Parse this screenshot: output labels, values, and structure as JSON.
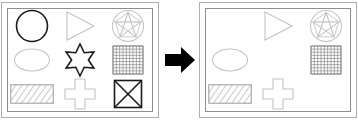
{
  "puzzle": {
    "title": "Shape set transformation",
    "type": "visual-analogy",
    "operator_label": "transforms-to",
    "arrow_direction": "right",
    "arrow_color": "#000000"
  },
  "colors": {
    "dark_stroke": "#1a1a1a",
    "light_stroke": "#c4c4c4",
    "grid_stroke": "#8a8a8a",
    "hatch_stroke": "#9a9a9a",
    "panel_border": "#aeaeae",
    "panel_inner_border": "#8d8d8d",
    "background": "#ffffff"
  },
  "panels": [
    {
      "id": "left",
      "name": "input-panel",
      "label": "Input set",
      "cells": [
        {
          "index": 0,
          "shape": "circle",
          "label": "Circle",
          "stroke": "dark",
          "present": true
        },
        {
          "index": 1,
          "shape": "triangle-right",
          "label": "Right triangle",
          "stroke": "light",
          "present": true
        },
        {
          "index": 2,
          "shape": "pentagram-circle",
          "label": "Pentagram in circle",
          "stroke": "light",
          "present": true
        },
        {
          "index": 3,
          "shape": "ellipse",
          "label": "Ellipse",
          "stroke": "light",
          "present": true
        },
        {
          "index": 4,
          "shape": "star-six",
          "label": "Six-pointed star",
          "stroke": "dark",
          "present": true
        },
        {
          "index": 5,
          "shape": "grid-square",
          "label": "Grid square",
          "stroke": "grid",
          "present": true
        },
        {
          "index": 6,
          "shape": "hatched-rect",
          "label": "Hatched rectangle",
          "stroke": "hatch",
          "present": true
        },
        {
          "index": 7,
          "shape": "cross",
          "label": "Cross",
          "stroke": "light",
          "present": true
        },
        {
          "index": 8,
          "shape": "crossed-square",
          "label": "Square with X",
          "stroke": "dark",
          "present": true
        }
      ]
    },
    {
      "id": "right",
      "name": "output-panel",
      "label": "Output set",
      "cells": [
        {
          "index": 0,
          "shape": "circle",
          "label": "Circle",
          "stroke": "dark",
          "present": false
        },
        {
          "index": 1,
          "shape": "triangle-right",
          "label": "Right triangle",
          "stroke": "light",
          "present": true
        },
        {
          "index": 2,
          "shape": "pentagram-circle",
          "label": "Pentagram in circle",
          "stroke": "light",
          "present": true
        },
        {
          "index": 3,
          "shape": "ellipse",
          "label": "Ellipse",
          "stroke": "light",
          "present": true
        },
        {
          "index": 4,
          "shape": "star-six",
          "label": "Six-pointed star",
          "stroke": "dark",
          "present": false
        },
        {
          "index": 5,
          "shape": "grid-square",
          "label": "Grid square",
          "stroke": "grid",
          "present": true
        },
        {
          "index": 6,
          "shape": "hatched-rect",
          "label": "Hatched rectangle",
          "stroke": "hatch",
          "present": true
        },
        {
          "index": 7,
          "shape": "cross",
          "label": "Cross",
          "stroke": "light",
          "present": true
        },
        {
          "index": 8,
          "shape": "crossed-square",
          "label": "Square with X",
          "stroke": "dark",
          "present": false
        }
      ]
    }
  ]
}
